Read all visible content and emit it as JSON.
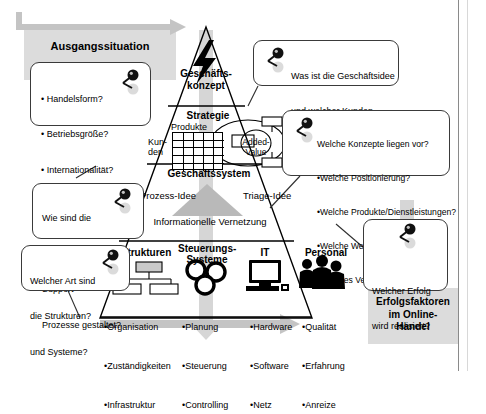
{
  "diagram": {
    "title_panels": {
      "left": "Ausgangssituation",
      "right_line1": "Erfolgsfaktoren",
      "right_line2": "im Online-",
      "right_line3": "Handel"
    },
    "pyramid": {
      "levels": [
        {
          "name": "Geschäfts-\nkonzept",
          "label_line1": "Geschäfts-",
          "label_line2": "konzept",
          "icon": "lightning-bolt-icon"
        },
        {
          "name": "Strategie",
          "label": "Strategie"
        },
        {
          "name": "Geschäftssystem",
          "label": "Geschäftssystem"
        }
      ],
      "strategy": {
        "axis_top": "Produkte",
        "axis_left_line1": "Kun-",
        "axis_left_line2": "den",
        "added_value_line1": "Added-",
        "added_value_line2": "Value"
      },
      "business_system": {
        "left_label": "Prozess-Idee",
        "right_label": "Triage-Idee",
        "bottom_label": "Informationelle Vernetzung"
      },
      "base_columns": [
        {
          "heading": "Strukturen",
          "icon": "org-chart-icon",
          "items": [
            "•Organisation",
            "•Zuständigkeiten",
            "•Infrastruktur"
          ]
        },
        {
          "heading_line1": "Steuerungs-",
          "heading_line2": "Systeme",
          "icon": "three-circles-icon",
          "items": [
            "•Planung",
            "•Steuerung",
            "•Controlling"
          ]
        },
        {
          "heading": "IT",
          "icon": "computer-icon",
          "items": [
            "•Hardware",
            "•Software",
            "•Netz"
          ]
        },
        {
          "heading": "Personal",
          "icon": "people-group-icon",
          "items": [
            "•Qualität",
            "•Erfahrung",
            "•Anreize"
          ]
        }
      ]
    },
    "callouts": [
      {
        "id": "ausgangssituation",
        "icon": "magnifier-pin-icon",
        "lines": [
          "• Handelsform?",
          "• Betriebsgröße?",
          "• Internationalität?",
          "• Historie?"
        ]
      },
      {
        "id": "geschaeftsidee",
        "icon": "magnifier-pin-icon",
        "lines": [
          "Was ist die Geschäftsidee",
          "und welcher Kunden-",
          "mehrwert wird geboten?"
        ]
      },
      {
        "id": "konzepte",
        "icon": "magnifier-pin-icon",
        "lines": [
          "Welche Konzepte liegen vor?",
          "•Welche Positionierung?",
          "•Welche Produkte/Dienstleistungen?",
          "•Welche Wertschöpfungstiefe?",
          "•Welches Vermarktungskonzept?"
        ]
      },
      {
        "id": "prozesse",
        "icon": "magnifier-pin-icon",
        "lines": [
          "Wie sind die",
          "Kern- und",
          "Support-",
          "Prozesse gestaltet?"
        ]
      },
      {
        "id": "strukturen",
        "icon": "magnifier-pin-icon",
        "lines": [
          "Welcher Art sind",
          "die Strukturen?",
          "und Systeme?"
        ]
      },
      {
        "id": "erfolg",
        "icon": "magnifier-pin-icon",
        "lines": [
          "Welcher Erfolg",
          "wird realisiert?"
        ]
      }
    ],
    "colors": {
      "panel_grey": "#dcdcdc",
      "arrow_grey": "#c4c4c4",
      "line_black": "#000000",
      "bubble_border": "#3a3a3a"
    }
  }
}
